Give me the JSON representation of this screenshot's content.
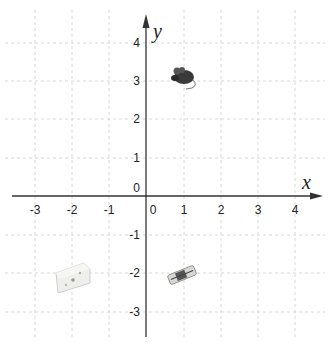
{
  "diagram": {
    "type": "cartesian-plane",
    "colors": {
      "axis": "#333333",
      "grid": "#d8d8d8",
      "label": "#222222"
    },
    "axes": {
      "x_label": "x",
      "y_label": "y",
      "x_ticks": [
        "-3",
        "-2",
        "-1",
        "0",
        "1",
        "2",
        "3",
        "4"
      ],
      "y_ticks": [
        "4",
        "3",
        "2",
        "1",
        "0",
        "-1",
        "-2",
        "-3"
      ],
      "origin_label": "0"
    },
    "objects": [
      {
        "name": "mouse",
        "label": "mouse",
        "x": 1,
        "y": 3
      },
      {
        "name": "cheese",
        "label": "cheese",
        "x": -2,
        "y": -2
      },
      {
        "name": "mousetrap",
        "label": "mousetrap",
        "x": 1,
        "y": -2
      }
    ]
  }
}
